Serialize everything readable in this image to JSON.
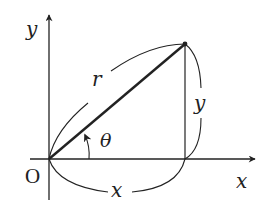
{
  "diagram": {
    "type": "polar-coordinate-triangle",
    "colors": {
      "stroke": "#222222",
      "background": "#ffffff"
    },
    "origin": {
      "label": "O",
      "x": 49,
      "y": 159
    },
    "point": {
      "x": 185,
      "y": 44
    },
    "axes": {
      "x": {
        "label": "x",
        "from": [
          30,
          159
        ],
        "to": [
          255,
          159
        ]
      },
      "y": {
        "label": "y",
        "from": [
          49,
          200
        ],
        "to": [
          49,
          15
        ]
      }
    },
    "labels": {
      "r": "r",
      "x": "x",
      "y": "y",
      "theta": "θ",
      "origin": "O",
      "x_axis": "x",
      "y_axis": "y"
    }
  }
}
